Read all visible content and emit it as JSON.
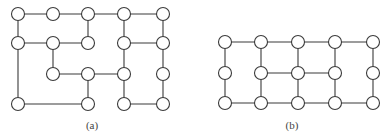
{
  "figure": {
    "node_radius": 6.5,
    "edge_color": "#3a3a3a",
    "node_fill": "#ffffff",
    "panels": [
      {
        "id": "a",
        "caption": "(a)",
        "caption_pos": [
          92,
          126
        ],
        "nodes": {
          "A0": [
            18,
            14
          ],
          "A1": [
            53,
            14
          ],
          "A2": [
            88,
            14
          ],
          "A3": [
            124,
            14
          ],
          "A4": [
            163,
            14
          ],
          "B0": [
            18,
            43
          ],
          "B1": [
            53,
            43
          ],
          "B2": [
            88,
            43
          ],
          "B3": [
            124,
            43
          ],
          "B4": [
            163,
            43
          ],
          "C1": [
            53,
            74
          ],
          "C2": [
            88,
            74
          ],
          "C3": [
            124,
            74
          ],
          "C4": [
            163,
            74
          ],
          "D0": [
            18,
            104
          ],
          "D2": [
            88,
            104
          ],
          "D3": [
            124,
            104
          ],
          "D4": [
            163,
            104
          ]
        },
        "edges": [
          [
            "A0",
            "A1"
          ],
          [
            "A1",
            "A2"
          ],
          [
            "A2",
            "A3"
          ],
          [
            "A3",
            "A4"
          ],
          [
            "A0",
            "B0"
          ],
          [
            "B0",
            "D0"
          ],
          [
            "A2",
            "B2"
          ],
          [
            "B0",
            "B1"
          ],
          [
            "B1",
            "B2"
          ],
          [
            "B1",
            "C1"
          ],
          [
            "C1",
            "C2"
          ],
          [
            "C2",
            "C3"
          ],
          [
            "C2",
            "D2"
          ],
          [
            "D0",
            "D2"
          ],
          [
            "A3",
            "B3"
          ],
          [
            "B3",
            "C3"
          ],
          [
            "C3",
            "D3"
          ],
          [
            "B3",
            "B4"
          ],
          [
            "A4",
            "B4"
          ],
          [
            "B4",
            "C4"
          ],
          [
            "C4",
            "D4"
          ],
          [
            "D3",
            "D4"
          ]
        ]
      },
      {
        "id": "b",
        "caption": "(b)",
        "caption_pos": [
          292,
          126
        ],
        "nodes": {
          "T0": [
            225,
            42
          ],
          "T1": [
            261,
            42
          ],
          "T2": [
            298,
            42
          ],
          "T3": [
            335,
            42
          ],
          "T4": [
            373,
            42
          ],
          "M0": [
            225,
            73
          ],
          "M1": [
            261,
            73
          ],
          "M2": [
            298,
            73
          ],
          "M3": [
            335,
            73
          ],
          "M4": [
            373,
            73
          ],
          "L0": [
            225,
            103
          ],
          "L1": [
            261,
            103
          ],
          "L2": [
            298,
            103
          ],
          "L3": [
            335,
            103
          ],
          "L4": [
            373,
            103
          ]
        },
        "edges": [
          [
            "T0",
            "T1"
          ],
          [
            "T1",
            "T2"
          ],
          [
            "T2",
            "T3"
          ],
          [
            "T3",
            "T4"
          ],
          [
            "L0",
            "L1"
          ],
          [
            "L1",
            "L2"
          ],
          [
            "L2",
            "L3"
          ],
          [
            "L3",
            "L4"
          ],
          [
            "M1",
            "M2"
          ],
          [
            "M2",
            "M3"
          ],
          [
            "T0",
            "M0"
          ],
          [
            "M0",
            "L0"
          ],
          [
            "T1",
            "M1"
          ],
          [
            "M1",
            "L1"
          ],
          [
            "T2",
            "M2"
          ],
          [
            "M2",
            "L2"
          ],
          [
            "T3",
            "M3"
          ],
          [
            "M3",
            "L3"
          ],
          [
            "T4",
            "M4"
          ],
          [
            "M4",
            "L4"
          ]
        ]
      }
    ]
  }
}
